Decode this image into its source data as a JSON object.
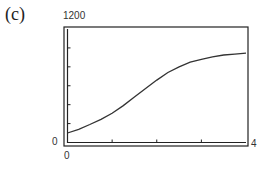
{
  "panel_label": "(c)",
  "chart_data": {
    "type": "line",
    "title": "",
    "xlabel": "",
    "ylabel": "",
    "xlim": [
      0,
      4
    ],
    "ylim": [
      0,
      1200
    ],
    "x_tick_labels": [
      "0",
      "4"
    ],
    "y_tick_labels": [
      "0",
      "1200"
    ],
    "x_ticks": [
      1,
      2,
      3
    ],
    "y_ticks": [
      200,
      400,
      600,
      800,
      1000
    ],
    "grid": false,
    "legend": null,
    "series": [
      {
        "name": "curve",
        "x": [
          0,
          0.25,
          0.5,
          0.75,
          1,
          1.25,
          1.5,
          1.75,
          2,
          2.25,
          2.5,
          2.75,
          3,
          3.25,
          3.5,
          3.75,
          4
        ],
        "y": [
          100,
          140,
          190,
          245,
          310,
          390,
          480,
          570,
          660,
          740,
          800,
          850,
          880,
          905,
          925,
          935,
          945
        ]
      }
    ]
  },
  "axis_labels": {
    "y_max": "1200",
    "y_min": "0",
    "x_min": "0",
    "x_max": "4"
  }
}
